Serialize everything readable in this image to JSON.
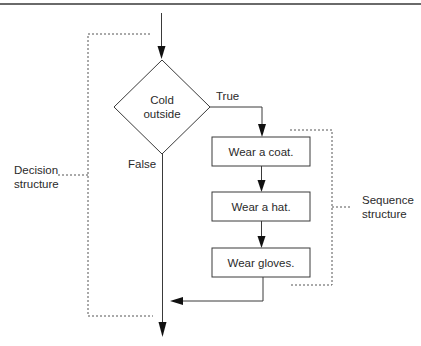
{
  "figure": {
    "top_rule": true,
    "decision": {
      "condition_line1": "Cold",
      "condition_line2": "outside",
      "true_label": "True",
      "false_label": "False"
    },
    "sequence_steps": [
      {
        "label": "Wear a coat."
      },
      {
        "label": "Wear a hat."
      },
      {
        "label": "Wear gloves."
      }
    ],
    "annotations": {
      "decision_structure_line1": "Decision",
      "decision_structure_line2": "structure",
      "sequence_structure_line1": "Sequence",
      "sequence_structure_line2": "structure"
    },
    "colors": {
      "line": "#3a3a3a",
      "text": "#2a2a2a",
      "background": "#ffffff"
    }
  }
}
